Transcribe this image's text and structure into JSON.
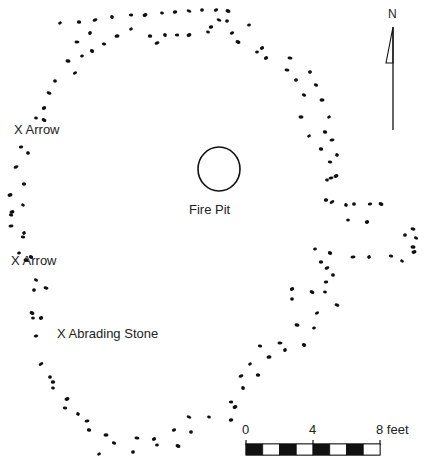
{
  "labels": {
    "arrow1": "X Arrow",
    "arrow2": "X Arrow",
    "abrading": "X Abrading Stone",
    "fire_pit": "Fire Pit",
    "north": "N"
  },
  "scale": {
    "tick0": "0",
    "tick4": "4",
    "tick8": "8 feet",
    "segments": 8
  },
  "colors": {
    "ink": "#111111",
    "background": "#ffffff"
  },
  "features": {
    "fire_pit": {
      "cx": 219,
      "cy": 169,
      "rx": 21,
      "ry": 22
    },
    "post_holes": [
      [
        60,
        23
      ],
      [
        79,
        22
      ],
      [
        95,
        20
      ],
      [
        112,
        17
      ],
      [
        131,
        15
      ],
      [
        145,
        15
      ],
      [
        162,
        13
      ],
      [
        175,
        12
      ],
      [
        189,
        11
      ],
      [
        202,
        10
      ],
      [
        216,
        10
      ],
      [
        228,
        11
      ],
      [
        249,
        25
      ],
      [
        262,
        48
      ],
      [
        290,
        58
      ],
      [
        310,
        72
      ],
      [
        316,
        85
      ],
      [
        322,
        100
      ],
      [
        329,
        117
      ],
      [
        325,
        132
      ],
      [
        332,
        140
      ],
      [
        337,
        155
      ],
      [
        330,
        162
      ],
      [
        336,
        176
      ],
      [
        327,
        180
      ],
      [
        326,
        200
      ],
      [
        332,
        202
      ],
      [
        354,
        204
      ],
      [
        370,
        204
      ],
      [
        381,
        204
      ],
      [
        348,
        220
      ],
      [
        367,
        222
      ],
      [
        413,
        229
      ],
      [
        405,
        235
      ],
      [
        416,
        238
      ],
      [
        413,
        247
      ],
      [
        315,
        249
      ],
      [
        330,
        253
      ],
      [
        353,
        257
      ],
      [
        369,
        257
      ],
      [
        391,
        256
      ],
      [
        414,
        252
      ],
      [
        402,
        261
      ],
      [
        321,
        262
      ],
      [
        327,
        268
      ],
      [
        333,
        275
      ],
      [
        326,
        282
      ],
      [
        312,
        292
      ],
      [
        325,
        292
      ],
      [
        292,
        289
      ],
      [
        337,
        305
      ],
      [
        292,
        299
      ],
      [
        317,
        313
      ],
      [
        297,
        325
      ],
      [
        314,
        328
      ],
      [
        304,
        345
      ],
      [
        280,
        343
      ],
      [
        285,
        350
      ],
      [
        260,
        346
      ],
      [
        269,
        357
      ],
      [
        250,
        364
      ],
      [
        258,
        375
      ],
      [
        241,
        376
      ],
      [
        243,
        388
      ],
      [
        231,
        402
      ],
      [
        235,
        407
      ],
      [
        209,
        417
      ],
      [
        231,
        420
      ],
      [
        189,
        417
      ],
      [
        191,
        432
      ],
      [
        174,
        430
      ],
      [
        178,
        446
      ],
      [
        157,
        445
      ],
      [
        154,
        439
      ],
      [
        137,
        438
      ],
      [
        133,
        452
      ],
      [
        114,
        443
      ],
      [
        106,
        435
      ],
      [
        99,
        454
      ],
      [
        89,
        430
      ],
      [
        87,
        421
      ],
      [
        78,
        414
      ],
      [
        65,
        408
      ],
      [
        67,
        399
      ],
      [
        53,
        388
      ],
      [
        53,
        382
      ],
      [
        41,
        364
      ],
      [
        50,
        377
      ],
      [
        36,
        336
      ],
      [
        32,
        313
      ],
      [
        33,
        318
      ],
      [
        41,
        318
      ],
      [
        46,
        288
      ],
      [
        34,
        290
      ],
      [
        36,
        280
      ],
      [
        26,
        260
      ],
      [
        19,
        253
      ],
      [
        31,
        257
      ],
      [
        11,
        226
      ],
      [
        24,
        233
      ],
      [
        11,
        215
      ],
      [
        10,
        195
      ],
      [
        23,
        205
      ],
      [
        24,
        184
      ],
      [
        16,
        167
      ],
      [
        28,
        153
      ],
      [
        21,
        147
      ],
      [
        44,
        120
      ],
      [
        36,
        118
      ],
      [
        44,
        108
      ],
      [
        49,
        93
      ],
      [
        55,
        81
      ],
      [
        75,
        73
      ],
      [
        68,
        61
      ],
      [
        82,
        56
      ],
      [
        92,
        51
      ],
      [
        77,
        42
      ],
      [
        90,
        33
      ],
      [
        104,
        44
      ],
      [
        117,
        36
      ],
      [
        131,
        29
      ],
      [
        150,
        36
      ],
      [
        157,
        43
      ],
      [
        165,
        35
      ],
      [
        177,
        35
      ],
      [
        189,
        35
      ],
      [
        208,
        32
      ],
      [
        211,
        27
      ],
      [
        219,
        20
      ],
      [
        227,
        21
      ],
      [
        232,
        33
      ],
      [
        238,
        42
      ],
      [
        257,
        52
      ],
      [
        266,
        58
      ],
      [
        287,
        70
      ],
      [
        296,
        80
      ],
      [
        304,
        95
      ],
      [
        301,
        117
      ],
      [
        309,
        136
      ],
      [
        321,
        149
      ],
      [
        331,
        178
      ],
      [
        346,
        205
      ],
      [
        23,
        237
      ],
      [
        12,
        212
      ]
    ]
  }
}
